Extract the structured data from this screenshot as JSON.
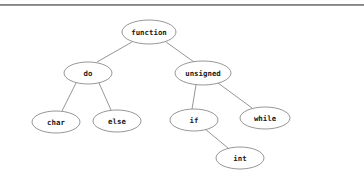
{
  "page": {
    "background_color": "#ffffff",
    "separator_color": "#6e6e6e"
  },
  "chart_data": {
    "type": "diagram",
    "subtype": "tree",
    "title": "",
    "node_shape": "ellipse",
    "node_fill": "#ffffff",
    "node_stroke": "#8a8a8a",
    "edge_stroke": "#8a8a8a",
    "label_color": "#1a1a1a",
    "nodes": [
      {
        "id": "function",
        "label": "function",
        "cx": 149,
        "cy": 32,
        "rx": 27,
        "ry": 12,
        "font_size": 7.4,
        "level": 0
      },
      {
        "id": "do",
        "label": "do",
        "cx": 88,
        "cy": 73,
        "rx": 24,
        "ry": 11,
        "font_size": 7.4,
        "level": 1
      },
      {
        "id": "unsigned",
        "label": "unsigned",
        "cx": 203,
        "cy": 73,
        "rx": 28,
        "ry": 12,
        "font_size": 7.4,
        "level": 1
      },
      {
        "id": "char",
        "label": "char",
        "cx": 56,
        "cy": 122,
        "rx": 24,
        "ry": 11,
        "font_size": 7.4,
        "level": 2
      },
      {
        "id": "else",
        "label": "else",
        "cx": 117,
        "cy": 121,
        "rx": 24,
        "ry": 11,
        "font_size": 7.4,
        "level": 2
      },
      {
        "id": "if",
        "label": "if",
        "cx": 194,
        "cy": 120,
        "rx": 24,
        "ry": 11,
        "font_size": 7.4,
        "level": 2
      },
      {
        "id": "while",
        "label": "while",
        "cx": 265,
        "cy": 118,
        "rx": 25,
        "ry": 11,
        "font_size": 7.4,
        "level": 2
      },
      {
        "id": "int",
        "label": "int",
        "cx": 240,
        "cy": 158,
        "rx": 24,
        "ry": 11,
        "font_size": 7.4,
        "level": 3
      }
    ],
    "edges": [
      {
        "from": "function",
        "to": "do",
        "x1": 132,
        "y1": 42,
        "x2": 97,
        "y2": 62
      },
      {
        "from": "function",
        "to": "unsigned",
        "x1": 166,
        "y1": 42,
        "x2": 194,
        "y2": 62
      },
      {
        "from": "do",
        "to": "char",
        "x1": 76,
        "y1": 83,
        "x2": 62,
        "y2": 111
      },
      {
        "from": "do",
        "to": "else",
        "x1": 99,
        "y1": 83,
        "x2": 111,
        "y2": 110
      },
      {
        "from": "unsigned",
        "to": "if",
        "x1": 196,
        "y1": 85,
        "x2": 192,
        "y2": 109
      },
      {
        "from": "unsigned",
        "to": "while",
        "x1": 218,
        "y1": 83,
        "x2": 252,
        "y2": 108
      },
      {
        "from": "if",
        "to": "int",
        "x1": 205,
        "y1": 129,
        "x2": 228,
        "y2": 148
      }
    ]
  }
}
